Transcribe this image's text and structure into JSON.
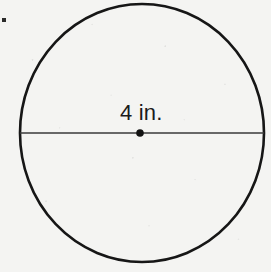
{
  "figure": {
    "kind": "geometry-diagram",
    "background_color": "#f4f4f2",
    "stroke_color": "#161616",
    "line_color": "#3a3a3a",
    "dot_color": "#121212",
    "text_color": "#1b1b1b",
    "canvas": {
      "width": 271,
      "height": 272
    },
    "circle": {
      "center_x": 142,
      "center_y": 133,
      "radius_x": 122,
      "radius_y": 129,
      "stroke_width": 2.6
    },
    "diameter_line": {
      "x1": 20,
      "y1": 133,
      "x2": 264,
      "y2": 133,
      "stroke_width": 1.6
    },
    "center_dot": {
      "cx": 140,
      "cy": 133,
      "r": 3.8
    },
    "label": {
      "text": "4 in.",
      "value": "4",
      "unit": "in.",
      "left": 120,
      "top": 102,
      "font_size": "22px"
    },
    "stray_mark": {
      "left": 2,
      "top": 18,
      "width": 4,
      "height": 4
    }
  }
}
